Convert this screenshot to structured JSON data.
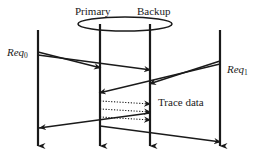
{
  "diagram": {
    "type": "sequence-diagram",
    "colors": {
      "stroke": "#1a1a1a",
      "background": "#ffffff",
      "dotted": "#555555"
    },
    "labels": {
      "primary": "Primary",
      "backup": "Backup",
      "req0_text": "Req",
      "req0_sub": "0",
      "req1_text": "Req",
      "req1_sub": "1",
      "trace_data": "Trace data"
    },
    "lifelines": [
      {
        "name": "client-left-lifeline",
        "x": 38,
        "y1": 30,
        "y2": 150
      },
      {
        "name": "primary-lifeline",
        "x": 100,
        "y1": 24,
        "y2": 150
      },
      {
        "name": "backup-lifeline",
        "x": 150,
        "y1": 24,
        "y2": 150
      },
      {
        "name": "client-right-lifeline",
        "x": 220,
        "y1": 30,
        "y2": 150
      }
    ],
    "group_ellipse": {
      "name": "primary-backup-group",
      "cx": 125,
      "cy": 24,
      "rx": 47,
      "ry": 7
    },
    "messages": [
      {
        "name": "req0-to-primary",
        "from_x": 38,
        "from_y": 53,
        "to_x": 100,
        "to_y": 68,
        "style": "solid",
        "arrow": "end"
      },
      {
        "name": "req0-to-backup",
        "from_x": 38,
        "from_y": 55,
        "to_x": 150,
        "to_y": 69,
        "style": "solid",
        "arrow": "end"
      },
      {
        "name": "req1-to-backup",
        "from_x": 220,
        "from_y": 62,
        "to_x": 150,
        "to_y": 84,
        "style": "solid",
        "arrow": "end"
      },
      {
        "name": "req1-to-primary",
        "from_x": 220,
        "from_y": 64,
        "to_x": 100,
        "to_y": 93,
        "style": "solid",
        "arrow": "end"
      },
      {
        "name": "primary-to-client-left",
        "from_x": 150,
        "from_y": 113,
        "to_x": 38,
        "to_y": 128,
        "style": "solid",
        "arrow": "end"
      },
      {
        "name": "primary-to-client-right",
        "from_x": 100,
        "from_y": 127,
        "to_x": 220,
        "to_y": 143,
        "style": "solid",
        "arrow": "end"
      },
      {
        "name": "trace-data-1",
        "from_x": 100,
        "from_y": 102,
        "to_x": 150,
        "to_y": 104,
        "style": "dotted",
        "arrow": "end"
      },
      {
        "name": "trace-data-2",
        "from_x": 100,
        "from_y": 110,
        "to_x": 150,
        "to_y": 112,
        "style": "dotted",
        "arrow": "end"
      },
      {
        "name": "trace-data-3",
        "from_x": 100,
        "from_y": 118,
        "to_x": 150,
        "to_y": 120,
        "style": "dotted",
        "arrow": "end"
      }
    ]
  }
}
